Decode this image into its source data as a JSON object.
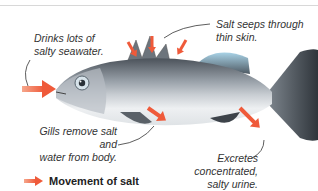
{
  "diagram": {
    "labels": {
      "drinks": "Drinks lots of salty seawater.",
      "drinks_line1": "Drinks lots of",
      "drinks_line2": "salty seawater.",
      "skin_line1": "Salt seeps through",
      "skin_line2": "thin skin.",
      "gills_line1": "Gills remove salt and",
      "gills_line2": "water from body.",
      "excretes_line1": "Excretes",
      "excretes_line2": "concentrated,",
      "excretes_line3": "salty urine."
    },
    "legend": {
      "label": "Movement of salt",
      "icon": "arrow-right-icon"
    },
    "colors": {
      "arrow": "#ef5a3a",
      "fish_body": "#8a9199",
      "fish_dark": "#3d434a",
      "belly": "#eef0f2",
      "text": "#333333"
    }
  }
}
